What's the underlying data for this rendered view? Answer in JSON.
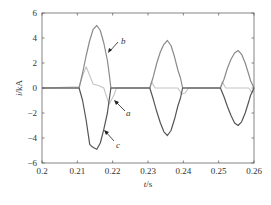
{
  "chart_data": {
    "type": "line",
    "title": "",
    "xlabel": "t/s",
    "ylabel": "i/kA",
    "xlim": [
      0.2,
      0.26
    ],
    "ylim": [
      -6,
      6
    ],
    "xticks": [
      0.2,
      0.21,
      0.22,
      0.23,
      0.24,
      0.25,
      0.26
    ],
    "xtick_labels": [
      "0.2",
      "0.21",
      "0.22",
      "0.23",
      "0.24",
      "0.25",
      "0.26"
    ],
    "yticks": [
      6,
      4,
      2,
      0,
      -2,
      -4,
      -6
    ],
    "ytick_labels": [
      "6",
      "4",
      "2",
      "0",
      "−2",
      "−4",
      "−6"
    ],
    "grid": false,
    "legend": "none (curves annotated with arrows a, b, c)",
    "series": [
      {
        "name": "a",
        "color": "#c4c4c4",
        "x": [
          0.2,
          0.2105,
          0.2115,
          0.2125,
          0.2135,
          0.2145,
          0.216,
          0.2175,
          0.219,
          0.2205,
          0.221,
          0.2215,
          0.2305,
          0.231,
          0.232,
          0.2385,
          0.2395,
          0.2405,
          0.2415,
          0.2505,
          0.251,
          0.252,
          0.2585,
          0.2595,
          0.26
        ],
        "y": [
          0,
          0.1,
          1.0,
          1.7,
          1.0,
          0.3,
          0.2,
          0.0,
          -1.3,
          -0.5,
          0.0,
          0.0,
          0.0,
          0.5,
          0.0,
          0.0,
          -0.5,
          -0.4,
          0.0,
          0.0,
          0.5,
          0.0,
          0.0,
          -0.4,
          0.0
        ]
      },
      {
        "name": "b",
        "color": "#8a8a8a",
        "x": [
          0.2,
          0.2105,
          0.2115,
          0.2125,
          0.2135,
          0.2145,
          0.2155,
          0.2165,
          0.2175,
          0.2185,
          0.219,
          0.2195,
          0.2305,
          0.2315,
          0.2325,
          0.2335,
          0.2345,
          0.2355,
          0.2365,
          0.2375,
          0.2385,
          0.2392,
          0.2398,
          0.2505,
          0.2515,
          0.2525,
          0.2535,
          0.2545,
          0.2555,
          0.2565,
          0.2575,
          0.2585,
          0.259,
          0.26
        ],
        "y": [
          0,
          0,
          1.2,
          2.6,
          3.8,
          4.7,
          5.0,
          4.6,
          3.6,
          2.2,
          1.2,
          0,
          0,
          0.9,
          2.0,
          2.9,
          3.5,
          3.8,
          3.4,
          2.5,
          1.4,
          0.8,
          0,
          0,
          0.7,
          1.6,
          2.3,
          2.8,
          3.0,
          2.7,
          2.0,
          1.1,
          0.6,
          0
        ]
      },
      {
        "name": "c",
        "color": "#555555",
        "x": [
          0.2,
          0.2105,
          0.2115,
          0.2125,
          0.2135,
          0.2142,
          0.2148,
          0.2155,
          0.2165,
          0.2175,
          0.2185,
          0.219,
          0.2195,
          0.2305,
          0.2315,
          0.2325,
          0.2335,
          0.2345,
          0.2355,
          0.2365,
          0.2375,
          0.2385,
          0.2392,
          0.2398,
          0.2505,
          0.2515,
          0.2525,
          0.2535,
          0.2545,
          0.2555,
          0.2565,
          0.2575,
          0.2585,
          0.259,
          0.26
        ],
        "y": [
          0,
          0,
          -1.0,
          -2.6,
          -4.5,
          -4.7,
          -4.8,
          -4.9,
          -4.4,
          -3.3,
          -2.0,
          -1.0,
          0,
          0,
          -0.9,
          -1.9,
          -2.8,
          -3.5,
          -3.8,
          -3.4,
          -2.5,
          -1.4,
          -0.8,
          0,
          0,
          -0.7,
          -1.5,
          -2.2,
          -2.8,
          -3.0,
          -2.7,
          -2.0,
          -1.1,
          -0.6,
          0
        ]
      }
    ],
    "annotations": [
      {
        "text": "a",
        "points_to": "light gray curve near t=0.219, i=-1.3"
      },
      {
        "text": "b",
        "points_to": "medium gray curve near t=0.218, i=3.0"
      },
      {
        "text": "c",
        "points_to": "dark gray curve near t=0.2185, i=-2.8"
      }
    ]
  },
  "labels": {
    "xlabel_italic": "t",
    "xlabel_unit": "/s",
    "ylabel_italic": "i",
    "ylabel_unit": "/kA",
    "curve_a": "a",
    "curve_b": "b",
    "curve_c": "c"
  }
}
